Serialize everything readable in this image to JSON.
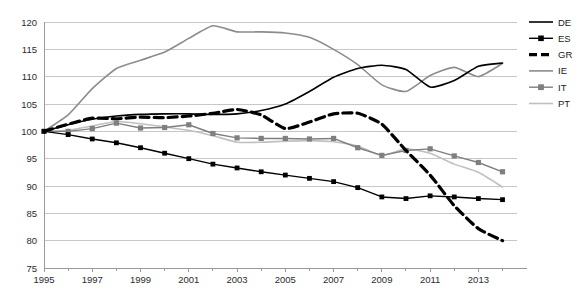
{
  "chart_data": {
    "type": "line",
    "title": "",
    "subtitle": "",
    "xlabel": "",
    "ylabel": "",
    "xlim": [
      1995,
      2014.6
    ],
    "ylim": [
      75,
      120
    ],
    "ytick_values": [
      75,
      80,
      85,
      90,
      95,
      100,
      105,
      110,
      115,
      120
    ],
    "ytick_labels": [
      "75",
      "80",
      "85",
      "90",
      "95",
      "100",
      "105",
      "110",
      "115",
      "120"
    ],
    "xtick_values": [
      1995,
      1996,
      1997,
      1998,
      1999,
      2000,
      2001,
      2002,
      2003,
      2004,
      2005,
      2006,
      2007,
      2008,
      2009,
      2010,
      2011,
      2012,
      2013,
      2014
    ],
    "xtick_labels": [
      "1995",
      "",
      "1997",
      "",
      "1999",
      "",
      "2001",
      "",
      "2003",
      "",
      "2005",
      "",
      "2007",
      "",
      "2009",
      "",
      "2011",
      "",
      "2013",
      ""
    ],
    "grid": true,
    "legend_position": "right",
    "x": [
      1995,
      1996,
      1997,
      1998,
      1999,
      2000,
      2001,
      2002,
      2003,
      2004,
      2005,
      2006,
      2007,
      2008,
      2009,
      2010,
      2011,
      2012,
      2013,
      2014
    ],
    "series": [
      {
        "name": "DE",
        "label": "DE",
        "color": "#000000",
        "style": "solid",
        "width": 1.6,
        "marker": "none",
        "values": [
          100.0,
          101.2,
          102.2,
          102.8,
          103.1,
          103.2,
          103.2,
          103.1,
          103.2,
          103.8,
          105.0,
          107.3,
          109.9,
          111.5,
          112.1,
          111.3,
          108.1,
          109.3,
          111.9,
          112.5
        ]
      },
      {
        "name": "ES",
        "label": "ES",
        "color": "#000000",
        "style": "solid",
        "width": 1.4,
        "marker": "square",
        "values": [
          100.0,
          99.4,
          98.6,
          97.9,
          97.0,
          96.0,
          95.0,
          94.0,
          93.3,
          92.6,
          92.0,
          91.4,
          90.8,
          89.7,
          88.0,
          87.7,
          88.2,
          88.0,
          87.7,
          87.5
        ]
      },
      {
        "name": "GR",
        "label": "GR",
        "color": "#000000",
        "style": "dashed",
        "width": 3.2,
        "marker": "none",
        "values": [
          100.0,
          101.3,
          102.4,
          102.3,
          102.6,
          102.5,
          102.8,
          103.3,
          104.0,
          103.0,
          100.5,
          101.7,
          103.2,
          103.3,
          101.3,
          96.5,
          92.0,
          86.4,
          82.2,
          80.0
        ]
      },
      {
        "name": "IE",
        "label": "IE",
        "color": "#8c8c8c",
        "style": "solid",
        "width": 1.6,
        "marker": "none",
        "values": [
          100.0,
          103.0,
          107.8,
          111.5,
          113.0,
          114.5,
          117.0,
          119.3,
          118.2,
          118.2,
          118.0,
          117.2,
          115.0,
          112.2,
          108.5,
          107.3,
          110.2,
          111.7,
          110.0,
          112.4
        ]
      },
      {
        "name": "IT",
        "label": "IT",
        "color": "#7f7f7f",
        "style": "solid",
        "width": 1.4,
        "marker": "circle",
        "values": [
          100.0,
          100.0,
          100.5,
          101.5,
          100.6,
          100.7,
          101.2,
          99.6,
          98.8,
          98.7,
          98.7,
          98.6,
          98.7,
          97.0,
          95.6,
          96.5,
          96.8,
          95.5,
          94.3,
          92.6
        ]
      },
      {
        "name": "PT",
        "label": "PT",
        "color": "#c0c0c0",
        "style": "solid",
        "width": 1.6,
        "marker": "none",
        "values": [
          100.0,
          100.2,
          101.0,
          101.8,
          101.4,
          100.8,
          100.2,
          99.2,
          98.0,
          98.0,
          98.2,
          98.3,
          98.1,
          97.3,
          95.6,
          96.8,
          96.0,
          94.0,
          92.5,
          89.8
        ]
      }
    ]
  },
  "legend": {
    "entries": [
      {
        "label": "DE",
        "icon": "line-swatch-solid-black"
      },
      {
        "label": "ES",
        "icon": "line-swatch-square-marker"
      },
      {
        "label": "GR",
        "icon": "line-swatch-thick-dashed"
      },
      {
        "label": "IE",
        "icon": "line-swatch-solid-gray"
      },
      {
        "label": "IT",
        "icon": "line-swatch-circle-marker"
      },
      {
        "label": "PT",
        "icon": "line-swatch-solid-lightgray"
      }
    ]
  }
}
